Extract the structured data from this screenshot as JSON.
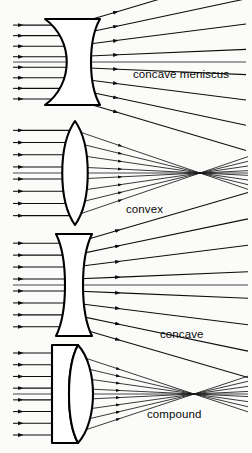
{
  "figure": {
    "width": 252,
    "height": 453,
    "background_color": "#fbfbfa",
    "ink_color": "#0d0d0d"
  },
  "panels": [
    {
      "id": "concave-meniscus",
      "label": "concave meniscus",
      "label_x": 133,
      "label_y": 78,
      "lens_type": "meniscus",
      "behaviour": "diverging",
      "axis_y": 62,
      "top": 8,
      "bottom": 112,
      "lens_x": 72,
      "lens_half_height": 45,
      "incoming_ray_count": 8,
      "incoming_start_x": 13,
      "arrow_in_x": 23,
      "outgoing_arrow_x": 118,
      "outgoing_end_x": 246,
      "divergence_spread": 46,
      "virtual_focus_x": -40
    },
    {
      "id": "convex",
      "label": "convex",
      "label_x": 126,
      "label_y": 213,
      "lens_type": "biconvex",
      "behaviour": "converging",
      "axis_y": 173,
      "top": 118,
      "bottom": 228,
      "lens_x": 75,
      "lens_half_height": 52,
      "incoming_ray_count": 8,
      "incoming_start_x": 13,
      "arrow_in_x": 23,
      "outgoing_arrow_x": 122,
      "outgoing_end_x": 248,
      "focus_x": 200,
      "focus_y": 173
    },
    {
      "id": "concave",
      "label": "concave",
      "label_x": 160,
      "label_y": 338,
      "lens_type": "biconcave",
      "behaviour": "diverging",
      "axis_y": 285,
      "top": 232,
      "bottom": 338,
      "lens_x": 74,
      "lens_half_height": 51,
      "incoming_ray_count": 8,
      "incoming_start_x": 13,
      "arrow_in_x": 23,
      "outgoing_arrow_x": 120,
      "outgoing_end_x": 248,
      "divergence_spread": 40,
      "virtual_focus_x": -55
    },
    {
      "id": "compound",
      "label": "compound",
      "label_x": 147,
      "label_y": 418,
      "lens_type": "doublet",
      "behaviour": "converging",
      "axis_y": 394,
      "top": 342,
      "bottom": 448,
      "lens_x": 70,
      "lens_half_height": 50,
      "incoming_ray_count": 8,
      "incoming_start_x": 13,
      "arrow_in_x": 23,
      "outgoing_arrow_x": 120,
      "outgoing_end_x": 248,
      "focus_x": 194,
      "focus_y": 394
    }
  ],
  "labels": {
    "concave_meniscus": "concave meniscus",
    "convex": "convex",
    "concave": "concave",
    "compound": "compound"
  }
}
